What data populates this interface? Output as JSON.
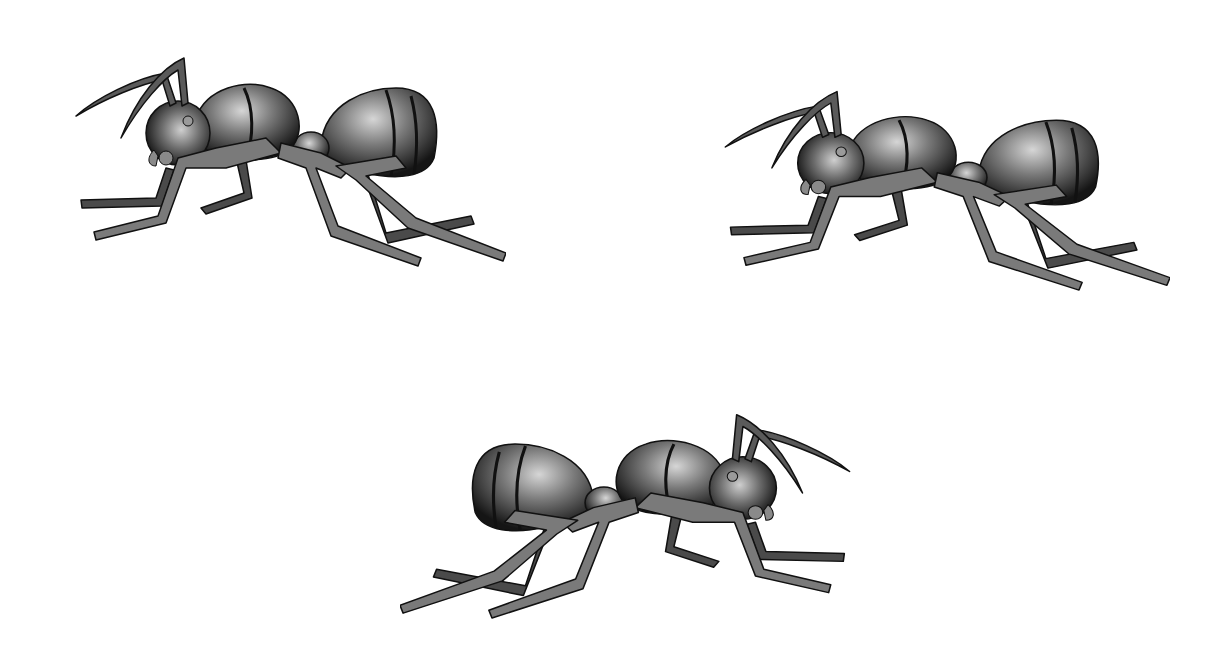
{
  "scene": {
    "title": "Three ants illustration",
    "background": "#ffffff",
    "colors": {
      "body_dark": "#1a1a1a",
      "body_mid": "#6b6b6b",
      "body_light": "#c8c8c8",
      "leg_fill": "#6e6e6e",
      "outline": "#111111"
    },
    "ants": [
      {
        "id": "ant-top-left",
        "facing": "left",
        "x": 66,
        "y": 48,
        "width": 440,
        "height": 220
      },
      {
        "id": "ant-top-right",
        "facing": "left",
        "x": 715,
        "y": 82,
        "width": 455,
        "height": 210
      },
      {
        "id": "ant-bottom-center",
        "facing": "right",
        "x": 400,
        "y": 405,
        "width": 460,
        "height": 215
      }
    ]
  }
}
